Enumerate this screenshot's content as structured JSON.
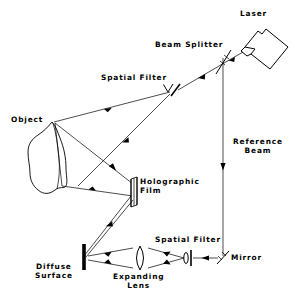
{
  "diagram": {
    "background_color": "#ffffff",
    "line_color": "#000000",
    "width": 295,
    "height": 297,
    "labels": {
      "laser": "Laser",
      "beam_splitter": "Beam Splitter",
      "spatial_filter_top": "Spatial Filter",
      "spatial_filter_bottom": "Spatial Filter",
      "object": "Object",
      "holographic_film": "Holographic\nFilm",
      "reference_beam": "Reference\nBeam",
      "mirror": "Mirror",
      "diffuse_surface": "Diffuse\nSurface",
      "expanding_lens": "Expanding\nLens"
    },
    "components": [
      {
        "name": "laser",
        "label": "Laser",
        "kind": "source",
        "x": 262,
        "y": 27
      },
      {
        "name": "beam-splitter",
        "label": "Beam Splitter",
        "kind": "beam-splitter",
        "x": 226,
        "y": 57
      },
      {
        "name": "spatial-filter-top",
        "label": "Spatial Filter",
        "kind": "spatial-filter",
        "x": 175,
        "y": 90
      },
      {
        "name": "object",
        "label": "Object",
        "kind": "object",
        "x": 58,
        "y": 160
      },
      {
        "name": "holographic-film",
        "label": "Holographic Film",
        "kind": "film",
        "x": 131,
        "y": 190
      },
      {
        "name": "diffuse-surface",
        "label": "Diffuse Surface",
        "kind": "diffuser",
        "x": 82,
        "y": 258
      },
      {
        "name": "expanding-lens",
        "label": "Expanding Lens",
        "kind": "lens",
        "x": 136,
        "y": 258
      },
      {
        "name": "spatial-filter-bot",
        "label": "Spatial Filter",
        "kind": "spatial-filter",
        "x": 192,
        "y": 258
      },
      {
        "name": "mirror",
        "label": "Mirror",
        "kind": "mirror",
        "x": 228,
        "y": 258
      }
    ],
    "beams": [
      {
        "name": "laser-to-splitter",
        "from": "laser",
        "to": "beam-splitter"
      },
      {
        "name": "splitter-to-spatial-filter",
        "from": "beam-splitter",
        "to": "spatial-filter-top"
      },
      {
        "name": "object-illumination",
        "from": "spatial-filter-top",
        "to": "object"
      },
      {
        "name": "object-to-film",
        "from": "object",
        "to": "holographic-film"
      },
      {
        "name": "reference-beam-vertical",
        "from": "beam-splitter",
        "to": "mirror"
      },
      {
        "name": "mirror-to-spatial-filter",
        "from": "mirror",
        "to": "spatial-filter-bot"
      },
      {
        "name": "spatial-filter-to-lens",
        "from": "spatial-filter-bot",
        "to": "expanding-lens"
      },
      {
        "name": "lens-to-diffuser",
        "from": "expanding-lens",
        "to": "diffuse-surface"
      },
      {
        "name": "diffuser-to-film",
        "from": "diffuse-surface",
        "to": "holographic-film"
      }
    ]
  }
}
